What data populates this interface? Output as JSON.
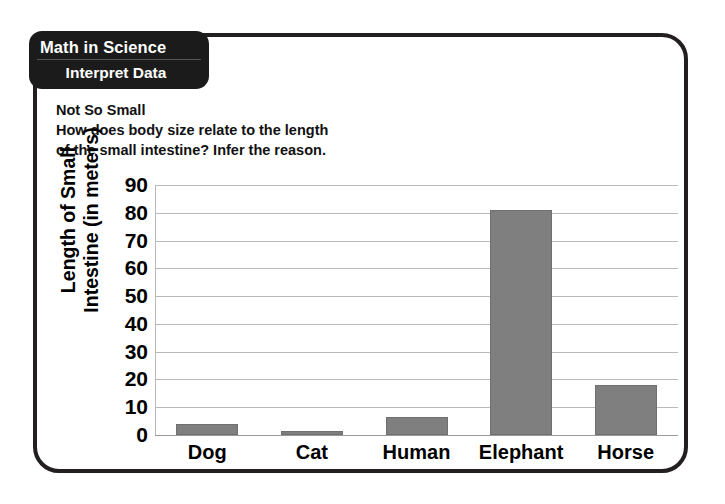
{
  "card": {
    "tab_line1": "Math in Science",
    "tab_line2": "Interpret Data",
    "heading_title": "Not So Small",
    "heading_question_line1": "How does body size relate to the length",
    "heading_question_line2": "of the small intestine? Infer the reason."
  },
  "colors": {
    "bar_fill": "#7f7f7f",
    "bar_stroke": "#6f6f6f",
    "frame": "#231f20",
    "tab_bg": "#1b1b1b",
    "gridline": "#b9b9b9"
  },
  "chart_data": {
    "type": "bar",
    "title": "Not So Small",
    "subtitle": "How does body size relate to the length of the small intestine? Infer the reason.",
    "categories": [
      "Dog",
      "Cat",
      "Human",
      "Elephant",
      "Horse"
    ],
    "values": [
      4,
      1.5,
      6.5,
      81,
      18
    ],
    "xlabel": "",
    "ylabel": "Length of Small Intestine (in meters)",
    "ylabel_line1": "Length of Small",
    "ylabel_line2": "Intestine (in meters)",
    "ylim": [
      0,
      90
    ],
    "yticks": [
      90,
      80,
      70,
      60,
      50,
      40,
      30,
      20,
      10,
      0
    ],
    "ytick_labels": [
      "90",
      "80",
      "70",
      "60",
      "50",
      "40",
      "30",
      "20",
      "10",
      "0"
    ],
    "grid": true,
    "legend": false,
    "legend_position": "none"
  }
}
